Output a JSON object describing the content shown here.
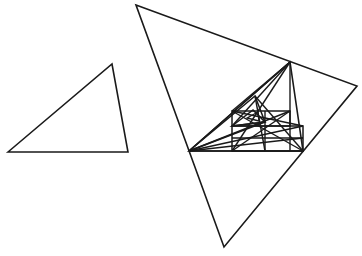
{
  "canvas": {
    "width": 362,
    "height": 256,
    "background_color": "#ffffff",
    "stroke_color": "#1a1a1a",
    "title": "Two outlined triangles: a plain scalene triangle at left and a large scalene triangle at right containing a recursively inscribed triangle lattice"
  },
  "figure": {
    "kind": "line-drawing",
    "text_labels": [],
    "shapes": [
      {
        "name": "small-triangle",
        "role": "reference-triangle",
        "closed": true,
        "stroke_width": 1.6,
        "points": [
          [
            8,
            152
          ],
          [
            112,
            64
          ],
          [
            128,
            152
          ]
        ]
      },
      {
        "name": "large-triangle",
        "role": "outer-boundary-triangle",
        "closed": true,
        "stroke_width": 1.6,
        "points": [
          [
            136,
            5
          ],
          [
            357,
            86
          ],
          [
            224,
            247
          ]
        ]
      },
      {
        "name": "inscribed-triangle-level-1",
        "role": "inscribed-similar-triangle",
        "closed": true,
        "stroke_width": 1.6,
        "points": [
          [
            189,
            151
          ],
          [
            290,
            62
          ],
          [
            303,
            151
          ]
        ]
      },
      {
        "name": "inscribed-triangle-level-2",
        "role": "inscribed-similar-triangle",
        "closed": true,
        "stroke_width": 1.5,
        "points": [
          [
            189,
            151
          ],
          [
            255,
            96
          ],
          [
            265,
            122
          ]
        ]
      },
      {
        "name": "inscribed-triangle-level-3",
        "role": "inscribed-similar-triangle",
        "closed": true,
        "stroke_width": 1.5,
        "points": [
          [
            232,
            126
          ],
          [
            253,
            110
          ],
          [
            265,
            122
          ]
        ]
      },
      {
        "name": "inscribed-triangle-level-4",
        "role": "inscribed-similar-triangle",
        "closed": true,
        "stroke_width": 1.4,
        "points": [
          [
            247,
            118
          ],
          [
            258,
            112
          ],
          [
            259,
            121
          ]
        ]
      }
    ],
    "polylines": [
      {
        "name": "grid-rect-outer",
        "role": "inscribed-rectangle",
        "closed": true,
        "stroke_width": 1.5,
        "points": [
          [
            232,
            126
          ],
          [
            303,
            126
          ],
          [
            303,
            151
          ],
          [
            232,
            151
          ]
        ]
      },
      {
        "name": "grid-rect-upper",
        "role": "inscribed-rectangle",
        "closed": true,
        "stroke_width": 1.5,
        "points": [
          [
            232,
            111
          ],
          [
            290,
            111
          ],
          [
            290,
            126
          ],
          [
            232,
            126
          ]
        ]
      },
      {
        "name": "grid-vertical-mid-a",
        "role": "lattice-line",
        "closed": false,
        "stroke_width": 1.4,
        "points": [
          [
            265,
            111
          ],
          [
            265,
            151
          ]
        ]
      },
      {
        "name": "grid-vertical-mid-b",
        "role": "lattice-line",
        "closed": false,
        "stroke_width": 1.4,
        "points": [
          [
            290,
            62
          ],
          [
            290,
            151
          ]
        ]
      },
      {
        "name": "grid-horizontal-mid",
        "role": "lattice-line",
        "closed": false,
        "stroke_width": 1.4,
        "points": [
          [
            232,
            138
          ],
          [
            303,
            138
          ]
        ]
      },
      {
        "name": "baseline-inner",
        "role": "lattice-line",
        "closed": false,
        "stroke_width": 1.5,
        "points": [
          [
            189,
            151
          ],
          [
            303,
            151
          ]
        ]
      },
      {
        "name": "cevian-left-to-apex",
        "role": "cevian",
        "closed": false,
        "stroke_width": 1.4,
        "points": [
          [
            189,
            151
          ],
          [
            290,
            62
          ]
        ]
      },
      {
        "name": "cevian-left-to-upper-right",
        "role": "cevian",
        "closed": false,
        "stroke_width": 1.4,
        "points": [
          [
            189,
            151
          ],
          [
            290,
            111
          ]
        ]
      },
      {
        "name": "cevian-left-to-rect-top",
        "role": "cevian",
        "closed": false,
        "stroke_width": 1.4,
        "points": [
          [
            189,
            151
          ],
          [
            303,
            126
          ]
        ]
      },
      {
        "name": "cevian-left-to-mid",
        "role": "cevian",
        "closed": false,
        "stroke_width": 1.4,
        "points": [
          [
            189,
            151
          ],
          [
            303,
            138
          ]
        ]
      },
      {
        "name": "cevian-apex-to-left",
        "role": "cevian",
        "closed": false,
        "stroke_width": 1.4,
        "points": [
          [
            290,
            62
          ],
          [
            232,
            126
          ]
        ]
      },
      {
        "name": "cevian-apex-to-rect-corner",
        "role": "cevian",
        "closed": false,
        "stroke_width": 1.4,
        "points": [
          [
            290,
            62
          ],
          [
            232,
            111
          ]
        ]
      },
      {
        "name": "cevian-apex-to-bottom-left",
        "role": "cevian",
        "closed": false,
        "stroke_width": 1.4,
        "points": [
          [
            290,
            62
          ],
          [
            232,
            151
          ]
        ]
      },
      {
        "name": "cevian-right-to-upper-left",
        "role": "cevian",
        "closed": false,
        "stroke_width": 1.4,
        "points": [
          [
            303,
            151
          ],
          [
            232,
            111
          ]
        ]
      },
      {
        "name": "cevian-right-to-inner-apex",
        "role": "cevian",
        "closed": false,
        "stroke_width": 1.4,
        "points": [
          [
            303,
            151
          ],
          [
            255,
            96
          ]
        ]
      },
      {
        "name": "cevian-rect-diag",
        "role": "cevian",
        "closed": false,
        "stroke_width": 1.4,
        "points": [
          [
            232,
            151
          ],
          [
            290,
            111
          ]
        ]
      },
      {
        "name": "cevian-inner-apex-to-base",
        "role": "cevian",
        "closed": false,
        "stroke_width": 1.4,
        "points": [
          [
            255,
            96
          ],
          [
            265,
            151
          ]
        ]
      },
      {
        "name": "cevian-short-cross",
        "role": "cevian",
        "closed": false,
        "stroke_width": 1.4,
        "points": [
          [
            232,
            126
          ],
          [
            265,
            122
          ]
        ]
      },
      {
        "name": "cevian-upper-band",
        "role": "cevian",
        "closed": false,
        "stroke_width": 1.4,
        "points": [
          [
            232,
            111
          ],
          [
            303,
            126
          ]
        ]
      }
    ]
  }
}
